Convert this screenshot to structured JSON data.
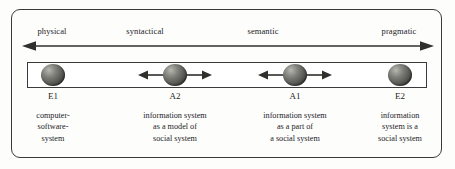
{
  "figure": {
    "frame_color": "#3a3a3a",
    "background": "#fdfdfc",
    "sphere_color": "#5f5f5b"
  },
  "axis": {
    "name": "semiotic-ladder-axis",
    "arrow_style": "double-headed",
    "labels": [
      {
        "text": "physical",
        "x": 52
      },
      {
        "text": "syntactical",
        "x": 145
      },
      {
        "text": "semantic",
        "x": 263
      },
      {
        "text": "pragmatic",
        "x": 399
      }
    ]
  },
  "nodes": [
    {
      "id": "E1",
      "x": 53,
      "has_arrows": false,
      "description": [
        "computer-",
        "software-",
        "system"
      ]
    },
    {
      "id": "A2",
      "x": 175,
      "has_arrows": true,
      "description": [
        "information system",
        "as a model of",
        "social system"
      ]
    },
    {
      "id": "A1",
      "x": 295,
      "has_arrows": true,
      "description": [
        "information system",
        "as a part of",
        "a social system"
      ]
    },
    {
      "id": "E2",
      "x": 400,
      "has_arrows": false,
      "description": [
        "information",
        "system is a",
        "social system"
      ]
    }
  ]
}
